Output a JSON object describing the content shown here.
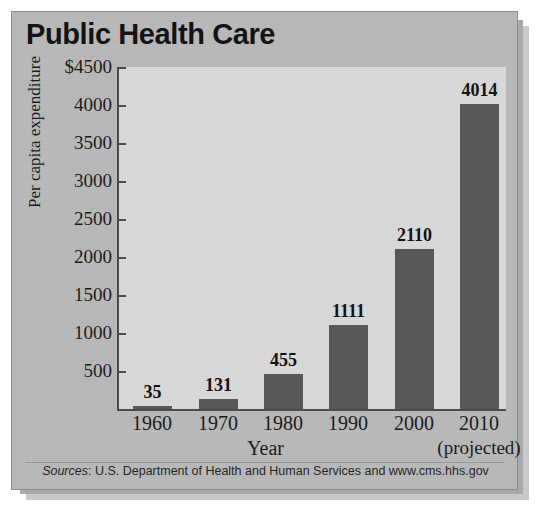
{
  "chart_data": {
    "type": "bar",
    "title": "Public Health Care",
    "xlabel": "Year",
    "ylabel": "Per capita expenditure",
    "categories": [
      "1960",
      "1970",
      "1980",
      "1990",
      "2000",
      "2010"
    ],
    "category_sublabels": [
      "",
      "",
      "",
      "",
      "",
      "(projected)"
    ],
    "values": [
      35,
      131,
      455,
      1111,
      2110,
      4014
    ],
    "value_labels": [
      "35",
      "131",
      "455",
      "1111",
      "2110",
      "4014"
    ],
    "ylim": [
      0,
      4500
    ],
    "yticks": [
      500,
      1000,
      1500,
      2000,
      2500,
      3000,
      3500,
      4000,
      4500
    ],
    "ytick_labels": [
      "500",
      "1000",
      "1500",
      "2000",
      "2500",
      "3000",
      "3500",
      "4000",
      "$4500"
    ],
    "grid": false,
    "legend": null,
    "bar_color": "#575757",
    "plot_background": "#d9d9d9",
    "card_background": "#b9b9b9"
  },
  "source": {
    "prefix": "Sources",
    "separator": ": ",
    "text": "U.S. Department of Health and Human Services and www.cms.hhs.gov"
  }
}
